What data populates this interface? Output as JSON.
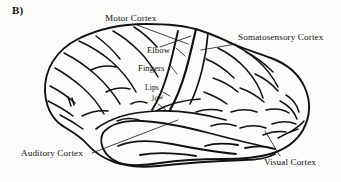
{
  "figure": {
    "panel_label": "B)",
    "caption_subject": "lateral view of human cerebral cortex with functional areas labelled",
    "line_color": "#111111",
    "background_color": "#fbfbfa"
  },
  "labels": {
    "motor_cortex": "Motor Cortex",
    "somatosensory_cortex": "Somatosensory Cortex",
    "elbow": "Elbow",
    "fingers": "Fingers",
    "lips": "Lips",
    "jaw": "Jaw",
    "auditory_cortex": "Auditory Cortex",
    "visual_cortex": "Visual Cortex"
  }
}
